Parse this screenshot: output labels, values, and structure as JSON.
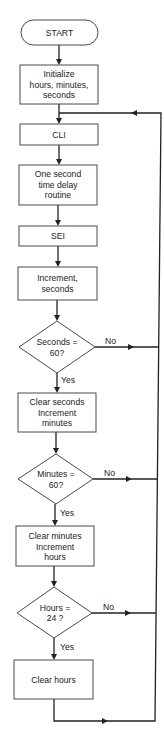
{
  "diagram": {
    "type": "flowchart",
    "colors": {
      "stroke": "#222222",
      "box_border": "#4a4a4a",
      "background": "#ffffff",
      "text": "#222222"
    },
    "nodes": [
      {
        "id": "start",
        "shape": "terminal",
        "lines": [
          "START"
        ]
      },
      {
        "id": "init",
        "shape": "process",
        "lines": [
          "Initialize",
          "hours, minutes,",
          "seconds"
        ]
      },
      {
        "id": "cli",
        "shape": "process",
        "lines": [
          "CLI"
        ]
      },
      {
        "id": "delay",
        "shape": "process",
        "lines": [
          "One second",
          "time delay",
          "routine"
        ]
      },
      {
        "id": "sei",
        "shape": "process",
        "lines": [
          "SEI"
        ]
      },
      {
        "id": "inc_sec",
        "shape": "process",
        "lines": [
          "Increment,",
          "seconds"
        ]
      },
      {
        "id": "dec_sec",
        "shape": "decision",
        "lines": [
          "Seconds =",
          "60?"
        ]
      },
      {
        "id": "clr_sec",
        "shape": "process",
        "lines": [
          "Clear seconds",
          "Increment",
          "minutes"
        ]
      },
      {
        "id": "dec_min",
        "shape": "decision",
        "lines": [
          "Minutes =",
          "60?"
        ]
      },
      {
        "id": "clr_min",
        "shape": "process",
        "lines": [
          "Clear minutes",
          "Increment",
          "hours"
        ]
      },
      {
        "id": "dec_hr",
        "shape": "decision",
        "lines": [
          "Hours =",
          "24 ?"
        ]
      },
      {
        "id": "clr_hr",
        "shape": "process",
        "lines": [
          "Clear hours"
        ]
      }
    ],
    "labels": {
      "yes": "Yes",
      "no": "No"
    },
    "edges": [
      {
        "from": "start",
        "to": "init"
      },
      {
        "from": "init",
        "to": "cli"
      },
      {
        "from": "cli",
        "to": "delay"
      },
      {
        "from": "delay",
        "to": "sei"
      },
      {
        "from": "sei",
        "to": "inc_sec"
      },
      {
        "from": "inc_sec",
        "to": "dec_sec"
      },
      {
        "from": "dec_sec",
        "to": "clr_sec",
        "label": "Yes"
      },
      {
        "from": "dec_sec",
        "to": "cli",
        "label": "No"
      },
      {
        "from": "clr_sec",
        "to": "dec_min"
      },
      {
        "from": "dec_min",
        "to": "clr_min",
        "label": "Yes"
      },
      {
        "from": "dec_min",
        "to": "cli",
        "label": "No"
      },
      {
        "from": "clr_min",
        "to": "dec_hr"
      },
      {
        "from": "dec_hr",
        "to": "clr_hr",
        "label": "Yes"
      },
      {
        "from": "dec_hr",
        "to": "cli",
        "label": "No"
      },
      {
        "from": "clr_hr",
        "to": "cli"
      }
    ]
  }
}
